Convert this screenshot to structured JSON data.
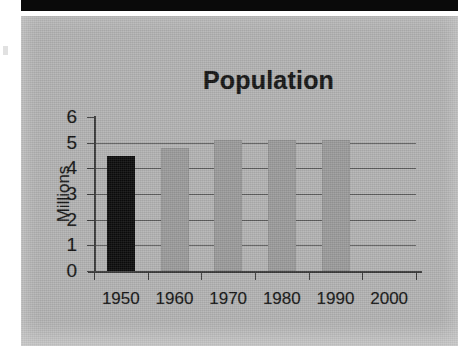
{
  "document": {
    "scan_top_bar": "",
    "panel_background_color": "#b3b3b3"
  },
  "chart_data": {
    "type": "bar",
    "title": "Population",
    "xlabel": "",
    "ylabel": "Millions",
    "categories": [
      "1950",
      "1960",
      "1970",
      "1980",
      "1990",
      "2000"
    ],
    "values": [
      4.5,
      4.8,
      5.1,
      5.1,
      5.1,
      null
    ],
    "series": [
      {
        "name": "Population",
        "values": [
          4.5,
          4.8,
          5.1,
          5.1,
          5.1,
          null
        ]
      }
    ],
    "bar_colors": [
      "#0c0c0c",
      "#9b9b9b",
      "#9b9b9b",
      "#9b9b9b",
      "#9b9b9b",
      null
    ],
    "ylim": [
      0,
      6
    ],
    "ytick_labels": [
      "6",
      "5",
      "4",
      "3",
      "2",
      "1",
      "0"
    ],
    "ytick_values": [
      6,
      5,
      4,
      3,
      2,
      1,
      0
    ],
    "grid": true,
    "grid_axis": "y",
    "legend": false,
    "legend_position": "none",
    "annotations": []
  }
}
